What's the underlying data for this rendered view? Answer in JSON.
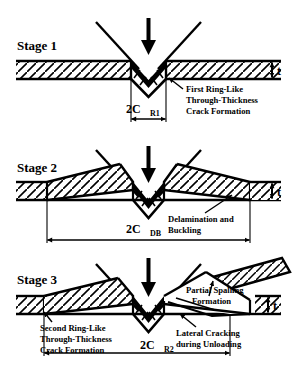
{
  "figure": {
    "type": "diagram",
    "background_color": "#ffffff",
    "line_color": "#000000"
  },
  "stages": [
    {
      "id": "stage-1",
      "label": "Stage 1",
      "load_arrow": "down-arrow-icon",
      "thickness_label": "t",
      "dimension": {
        "base": "2C",
        "subscript": "R1",
        "full": "2CR1"
      },
      "annotations": [
        {
          "id": "first-ring-crack",
          "lines": [
            "First Ring-Like",
            "Through-Thickness",
            "Crack Formation"
          ]
        }
      ]
    },
    {
      "id": "stage-2",
      "label": "Stage 2",
      "load_arrow": "down-arrow-icon",
      "thickness_label": "t",
      "dimension": {
        "base": "2C",
        "subscript": "DB",
        "full": "2CDB"
      },
      "annotations": [
        {
          "id": "delamination-buckling",
          "lines": [
            "Delamination and",
            "Buckling"
          ]
        }
      ]
    },
    {
      "id": "stage-3",
      "label": "Stage 3",
      "load_arrow": "down-arrow-icon",
      "thickness_label": "t",
      "dimension": {
        "base": "2C",
        "subscript": "R2",
        "full": "2CR2"
      },
      "annotations": [
        {
          "id": "second-ring-crack",
          "lines": [
            "Second Ring-Like",
            "Through-Thickness",
            "Crack Formation"
          ]
        },
        {
          "id": "partial-spalling",
          "lines": [
            "Partial Spalling",
            "Formation"
          ]
        },
        {
          "id": "lateral-cracking",
          "lines": [
            "Lateral Cracking",
            "during Unloading"
          ]
        }
      ]
    }
  ]
}
